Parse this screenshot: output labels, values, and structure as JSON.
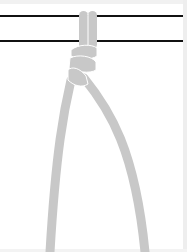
{
  "diagram": {
    "type": "knot-illustration",
    "colors": {
      "rope": "#c8c8c8",
      "rope_highlight": "#ffffff",
      "bar": "#111111",
      "background": "#ffffff",
      "frame": "#eeeeee"
    },
    "bars": [
      {
        "y": 16
      },
      {
        "y": 41
      }
    ]
  }
}
